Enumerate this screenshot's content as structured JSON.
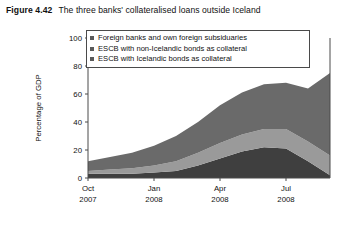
{
  "figure": {
    "label": "Figure 4.42",
    "title": "The three banks' collateralised loans outside Iceland"
  },
  "legend": {
    "position": "top-inside",
    "items": [
      {
        "label": "Foreign banks and own foreign subsiduaries",
        "color": "#595959",
        "swatch": "legend-swatch"
      },
      {
        "label": "ESCB with non-Icelandic bonds as collateral",
        "color": "#595959",
        "swatch": "legend-swatch"
      },
      {
        "label": "ESCB with Icelandic bonds as collateral",
        "color": "#595959",
        "swatch": "legend-swatch"
      }
    ]
  },
  "axes": {
    "y_title": "Percentage of GDP",
    "y_ticks": [
      "0",
      "20",
      "40",
      "60",
      "80",
      "100"
    ],
    "x_ticks": [
      {
        "month": "Oct",
        "year": "2007"
      },
      {
        "month": "Jan",
        "year": "2008"
      },
      {
        "month": "Apr",
        "year": "2008"
      },
      {
        "month": "Jul",
        "year": "2008"
      }
    ]
  },
  "chart_data": {
    "type": "area",
    "title": "The three banks' collateralised loans outside Iceland",
    "xlabel": "",
    "ylabel": "Percentage of GDP",
    "ylim": [
      0,
      100
    ],
    "grid": false,
    "legend_position": "top-inside",
    "stacked": true,
    "x": [
      "Oct 2007",
      "Nov 2007",
      "Dec 2007",
      "Jan 2008",
      "Feb 2008",
      "Mar 2008",
      "Apr 2008",
      "May 2008",
      "Jun 2008",
      "Jul 2008",
      "Aug 2008",
      "Sep 2008"
    ],
    "x_tick_labels": [
      "Oct 2007",
      "Jan 2008",
      "Apr 2008",
      "Jul 2008"
    ],
    "series": [
      {
        "name": "ESCB with Icelandic bonds as collateral",
        "color": "#3f3f3f",
        "order": "bottom",
        "values": [
          3,
          3,
          3,
          4,
          5,
          9,
          14,
          19,
          22,
          21,
          12,
          2
        ]
      },
      {
        "name": "ESCB with non-Icelandic bonds as collateral",
        "color": "#9a9a9a",
        "order": "middle",
        "values": [
          2,
          3,
          4,
          5,
          7,
          9,
          11,
          12,
          13,
          14,
          14,
          14
        ]
      },
      {
        "name": "Foreign banks and own foreign subsiduaries",
        "color": "#6a6a6a",
        "order": "top",
        "values": [
          7,
          9,
          11,
          14,
          18,
          22,
          27,
          30,
          32,
          33,
          38,
          59
        ]
      }
    ],
    "totals": [
      12,
      15,
      18,
      23,
      30,
      40,
      52,
      61,
      67,
      68,
      64,
      75
    ]
  },
  "colors": {
    "series_top": "#6a6a6a",
    "series_middle": "#9a9a9a",
    "series_bottom": "#3f3f3f",
    "axis": "#4a4a4a",
    "text": "#111111",
    "background": "#ffffff"
  }
}
